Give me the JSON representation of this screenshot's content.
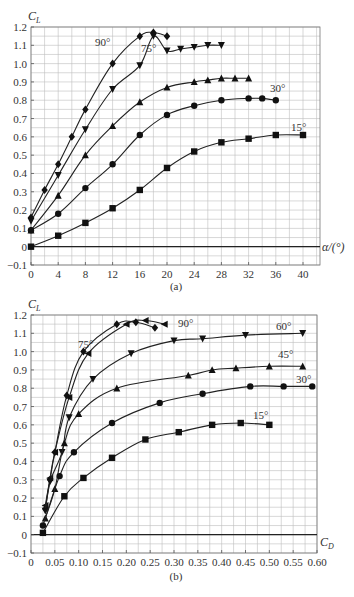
{
  "chart_data": [
    {
      "id": "a",
      "type": "line",
      "caption": "(a)",
      "title": "",
      "xlabel": "α/(°)",
      "ylabel": "C_L",
      "ylabel_main": "C",
      "ylabel_sub": "L",
      "xlim": [
        0,
        42.5
      ],
      "ylim": [
        -0.1,
        1.2
      ],
      "xticks": [
        0,
        4,
        8,
        12,
        16,
        20,
        24,
        28,
        32,
        36,
        40
      ],
      "xtick_labels": [
        "0",
        "4",
        "8",
        "12",
        "16",
        "20",
        "24",
        "28",
        "32",
        "36",
        "40"
      ],
      "yticks": [
        -0.1,
        0,
        0.1,
        0.2,
        0.3,
        0.4,
        0.5,
        0.6,
        0.7,
        0.8,
        0.9,
        1.0,
        1.1,
        1.2
      ],
      "ytick_labels": [
        "-0.1",
        "0",
        "0.1",
        "0.2",
        "0.3",
        "0.4",
        "0.5",
        "0.6",
        "0.7",
        "0.8",
        "0.9",
        "1.0",
        "1.1",
        "1.2"
      ],
      "grid": true,
      "series": [
        {
          "name": "90°",
          "label": "90°",
          "marker": "diamond",
          "x": [
            0,
            2,
            4,
            6,
            8,
            12,
            16,
            18,
            20
          ],
          "y": [
            0.16,
            0.31,
            0.45,
            0.6,
            0.75,
            1.0,
            1.15,
            1.17,
            1.15
          ],
          "label_pos": [
            95,
            46
          ]
        },
        {
          "name": "75°",
          "label": "75°",
          "marker": "triangle-down",
          "x": [
            0,
            4,
            8,
            12,
            16,
            18,
            20,
            22,
            24,
            26,
            28
          ],
          "y": [
            0.14,
            0.39,
            0.64,
            0.86,
            0.99,
            1.15,
            1.07,
            1.08,
            1.09,
            1.1,
            1.1
          ],
          "label_pos": [
            141,
            52
          ]
        },
        {
          "name": "60°",
          "label": "",
          "marker": "triangle-up",
          "x": [
            0,
            4,
            8,
            12,
            16,
            20,
            24,
            26,
            28,
            30,
            32
          ],
          "y": [
            0.09,
            0.28,
            0.5,
            0.66,
            0.79,
            0.87,
            0.9,
            0.91,
            0.92,
            0.92,
            0.92
          ],
          "label_pos": null
        },
        {
          "name": "30°",
          "label": "30°",
          "marker": "circle",
          "x": [
            0,
            4,
            8,
            12,
            16,
            20,
            24,
            28,
            32,
            34,
            36
          ],
          "y": [
            0.09,
            0.18,
            0.32,
            0.45,
            0.61,
            0.72,
            0.77,
            0.8,
            0.81,
            0.81,
            0.8
          ],
          "label_pos": [
            270,
            92
          ]
        },
        {
          "name": "15°",
          "label": "15°",
          "marker": "square",
          "x": [
            0,
            4,
            8,
            12,
            16,
            20,
            24,
            28,
            32,
            36,
            40
          ],
          "y": [
            0.0,
            0.06,
            0.13,
            0.21,
            0.31,
            0.43,
            0.52,
            0.57,
            0.59,
            0.61,
            0.61
          ],
          "label_pos": [
            291,
            131
          ]
        }
      ]
    },
    {
      "id": "b",
      "type": "line",
      "caption": "(b)",
      "title": "",
      "xlabel": "C_D",
      "xlabel_main": "C",
      "xlabel_sub": "D",
      "ylabel": "C_L",
      "ylabel_main": "C",
      "ylabel_sub": "L",
      "xlim": [
        0,
        0.6
      ],
      "ylim": [
        -0.1,
        1.2
      ],
      "xticks": [
        0,
        0.05,
        0.1,
        0.15,
        0.2,
        0.25,
        0.3,
        0.35,
        0.4,
        0.45,
        0.5,
        0.55,
        0.6
      ],
      "xtick_labels": [
        "0",
        "0.05",
        "0.10",
        "0.15",
        "0.20",
        "0.25",
        "0.30",
        "0.35",
        "0.40",
        "0.45",
        "0.50",
        "0.55",
        "0.60"
      ],
      "yticks": [
        -0.1,
        0,
        0.1,
        0.2,
        0.3,
        0.4,
        0.5,
        0.6,
        0.7,
        0.8,
        0.9,
        1.0,
        1.1,
        1.2
      ],
      "ytick_labels": [
        "-0.1",
        "0",
        "0.1",
        "0.2",
        "0.3",
        "0.4",
        "0.5",
        "0.6",
        "0.7",
        "0.8",
        "0.9",
        "1.0",
        "1.1",
        "1.2"
      ],
      "grid": true,
      "series": [
        {
          "name": "90°",
          "label": "90°",
          "marker": "triangle-left",
          "x": [
            0.03,
            0.04,
            0.05,
            0.08,
            0.12,
            0.2,
            0.24,
            0.28
          ],
          "y": [
            0.16,
            0.31,
            0.45,
            0.75,
            0.99,
            1.15,
            1.17,
            1.15
          ],
          "label_pos": [
            178,
            327
          ]
        },
        {
          "name": "75°",
          "label": "75°",
          "marker": "diamond",
          "x": [
            0.03,
            0.04,
            0.05,
            0.075,
            0.11,
            0.18,
            0.22,
            0.26
          ],
          "y": [
            0.14,
            0.3,
            0.45,
            0.76,
            1.0,
            1.15,
            1.16,
            1.13
          ],
          "label_pos": [
            78,
            348
          ]
        },
        {
          "name": "60°",
          "label": "60°",
          "marker": "triangle-down",
          "x": [
            0.03,
            0.04,
            0.065,
            0.08,
            0.13,
            0.21,
            0.3,
            0.36,
            0.45,
            0.57
          ],
          "y": [
            0.13,
            0.29,
            0.45,
            0.64,
            0.85,
            0.99,
            1.06,
            1.07,
            1.09,
            1.1
          ],
          "label_pos": [
            276,
            330
          ]
        },
        {
          "name": "45°",
          "label": "45°",
          "marker": "triangle-up",
          "x": [
            0.03,
            0.05,
            0.07,
            0.1,
            0.18,
            0.33,
            0.38,
            0.43,
            0.5,
            0.57
          ],
          "y": [
            0.09,
            0.25,
            0.5,
            0.66,
            0.8,
            0.87,
            0.9,
            0.91,
            0.92,
            0.92
          ],
          "label_pos": [
            278,
            358
          ]
        },
        {
          "name": "30°",
          "label": "30°",
          "marker": "circle",
          "x": [
            0.025,
            0.06,
            0.09,
            0.17,
            0.27,
            0.36,
            0.46,
            0.53,
            0.59
          ],
          "y": [
            0.05,
            0.32,
            0.45,
            0.61,
            0.72,
            0.77,
            0.81,
            0.81,
            0.81
          ],
          "label_pos": [
            296,
            383
          ]
        },
        {
          "name": "15°",
          "label": "15°",
          "marker": "square",
          "x": [
            0.025,
            0.07,
            0.11,
            0.17,
            0.24,
            0.31,
            0.38,
            0.44,
            0.5
          ],
          "y": [
            0.01,
            0.21,
            0.31,
            0.42,
            0.52,
            0.56,
            0.6,
            0.61,
            0.6
          ],
          "label_pos": [
            253,
            419
          ]
        }
      ]
    }
  ]
}
